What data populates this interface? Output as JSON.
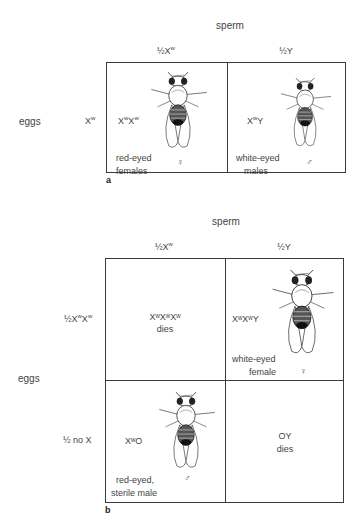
{
  "panel_a": {
    "letter": "a",
    "sperm_label": "sperm",
    "eggs_label": "eggs",
    "columns": [
      {
        "prefix": "½X",
        "sup": "w"
      },
      {
        "prefix": "½Y",
        "sup": ""
      }
    ],
    "rows": [
      {
        "prefix": "X",
        "sup": "w"
      }
    ],
    "cells": [
      {
        "genotype": [
          {
            "t": "X",
            "s": "w"
          },
          {
            "t": "X",
            "s": "w"
          }
        ],
        "phenotype_line1": "red-eyed",
        "phenotype_line2": "females",
        "sex_symbol": "♀",
        "fly": "female-fly-icon"
      },
      {
        "genotype": [
          {
            "t": "X",
            "s": "w"
          },
          {
            "t": "Y",
            "s": ""
          }
        ],
        "phenotype_line1": "white-eyed",
        "phenotype_line2": "males",
        "sex_symbol": "♂",
        "fly": "male-fly-icon"
      }
    ]
  },
  "panel_b": {
    "letter": "b",
    "sperm_label": "sperm",
    "eggs_label": "eggs",
    "columns": [
      {
        "prefix": "½X",
        "sup": "w"
      },
      {
        "prefix": "½Y",
        "sup": ""
      }
    ],
    "rows": [
      {
        "label": "½X",
        "sup1": "w",
        "mid": "X",
        "sup2": "w"
      },
      {
        "label": "½ no X"
      }
    ],
    "cells": [
      {
        "genotype_text": "XʷXʷXʷ",
        "outcome": "dies"
      },
      {
        "genotype_text": "XʷXʷY",
        "phenotype_line1": "white-eyed",
        "phenotype_line2": "female",
        "sex_symbol": "♀",
        "fly": "female-fly-icon"
      },
      {
        "genotype_text": "XʷO",
        "phenotype_line1": "red-eyed,",
        "phenotype_line2": "sterile male",
        "sex_symbol": "♂",
        "fly": "male-fly-icon"
      },
      {
        "genotype_text": "OY",
        "outcome": "dies"
      }
    ]
  }
}
